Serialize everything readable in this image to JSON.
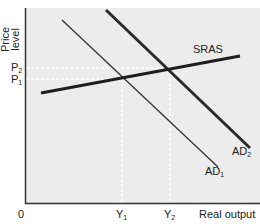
{
  "diagram": {
    "type": "AD-AS shift",
    "y_axis_label_line1": "Price",
    "y_axis_label_line2": "level",
    "x_axis_label": "Real output",
    "origin_label": "0",
    "price_ticks": [
      {
        "label": "P",
        "sub": "2",
        "y": 68
      },
      {
        "label": "P",
        "sub": "1",
        "y": 79
      }
    ],
    "output_ticks": [
      {
        "label": "Y",
        "sub": "1",
        "x": 122
      },
      {
        "label": "Y",
        "sub": "2",
        "x": 170
      }
    ],
    "curves": [
      {
        "name": "SRAS",
        "label": "SRAS",
        "from": [
          41,
          93
        ],
        "to": [
          240,
          56
        ],
        "width": 3
      },
      {
        "name": "AD1",
        "label": "AD",
        "sub": "1",
        "from": [
          62,
          20
        ],
        "to": [
          218,
          167
        ],
        "width": 1.3
      },
      {
        "name": "AD2",
        "label": "AD",
        "sub": "2",
        "from": [
          106,
          10
        ],
        "to": [
          250,
          148
        ],
        "width": 3
      }
    ],
    "colors": {
      "plot_bg": "#ececec",
      "axis": "#333333",
      "curve": "#2b2b2b",
      "guide": "#ffffff"
    }
  }
}
